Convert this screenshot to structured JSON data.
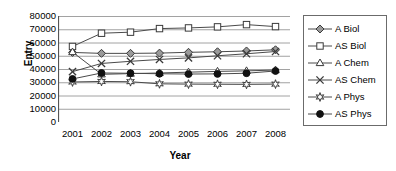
{
  "chart_data": {
    "type": "line",
    "title": "",
    "xlabel": "Year",
    "ylabel": "Entry",
    "categories": [
      "2001",
      "2002",
      "2003",
      "2004",
      "2005",
      "2006",
      "2007",
      "2008"
    ],
    "ylim": [
      0,
      80000
    ],
    "ytick_step": 10000,
    "yticks": [
      "80000",
      "70000",
      "60000",
      "50000",
      "40000",
      "30000",
      "20000",
      "10000",
      "0"
    ],
    "grid": true,
    "legend_position": "right",
    "series": [
      {
        "name": "A Biol",
        "marker": "filled-diamond",
        "values": [
          52500,
          51800,
          51800,
          52000,
          52600,
          53000,
          53600,
          54500
        ]
      },
      {
        "name": "AS Biol",
        "marker": "open-square",
        "values": [
          57000,
          67000,
          67800,
          70500,
          71000,
          71800,
          73500,
          72000
        ]
      },
      {
        "name": "A Chem",
        "marker": "open-triangle",
        "values": [
          52800,
          36000,
          36500,
          37000,
          37600,
          38200,
          38600,
          39200
        ]
      },
      {
        "name": "AS Chem",
        "marker": "cross-x",
        "values": [
          38000,
          44200,
          45800,
          47200,
          48400,
          50000,
          51500,
          53200
        ]
      },
      {
        "name": "A Phys",
        "marker": "open-star",
        "values": [
          30200,
          30600,
          30400,
          28800,
          28600,
          28500,
          28400,
          28600
        ]
      },
      {
        "name": "AS Phys",
        "marker": "filled-circle",
        "values": [
          32500,
          37000,
          36800,
          36400,
          36200,
          36300,
          36800,
          38500
        ]
      }
    ]
  }
}
